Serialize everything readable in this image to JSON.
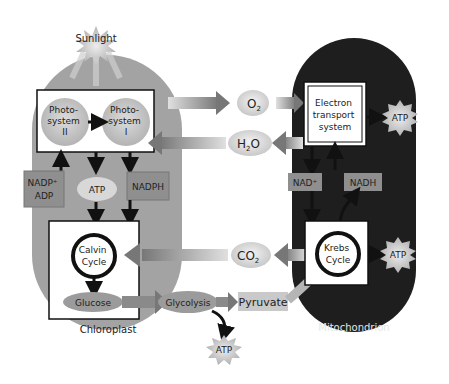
{
  "diagram": {
    "type": "flow",
    "colors": {
      "chloroplast": "#a3a3a3",
      "mitochondrion": "#1e1e1e",
      "box": "#ffffff",
      "oval": "#d9d9d9",
      "glucose_oval": "#9b9b9b",
      "label_box": "#8f8f8f",
      "arrow_gray": "#7a7a7a",
      "arrow_black": "#111111",
      "atp_star": "#cfcfcf"
    },
    "sunlight": {
      "label": "Sunlight"
    },
    "chloroplast": {
      "label": "Chloroplast",
      "photosystem2": {
        "line1": "Photo-",
        "line2": "system",
        "line3": "II"
      },
      "photosystem1": {
        "line1": "Photo-",
        "line2": "system",
        "line3": "I"
      },
      "nadp_adp": {
        "line1": "NADP⁺",
        "line2": "ADP"
      },
      "atp": "ATP",
      "nadph": "NADPH",
      "calvin": {
        "line1": "Calvin",
        "line2": "Cycle"
      },
      "glucose": "Glucose"
    },
    "middle": {
      "o2": {
        "base": "O",
        "sub": "2"
      },
      "h2o": {
        "pre": "H",
        "sub": "2",
        "post": "O"
      },
      "co2": {
        "base": "CO",
        "sub": "2"
      },
      "glycolysis": "Glycolysis",
      "pyruvate": "Pyruvate",
      "atp": "ATP"
    },
    "mitochondrion": {
      "label": "Mitochondrion",
      "ets": {
        "line1": "Electron",
        "line2": "transport",
        "line3": "system"
      },
      "ets_atp": "ATP",
      "nad": "NAD⁺",
      "nadh": "NADH",
      "krebs": {
        "line1": "Krebs",
        "line2": "Cycle"
      },
      "krebs_atp": "ATP"
    }
  }
}
